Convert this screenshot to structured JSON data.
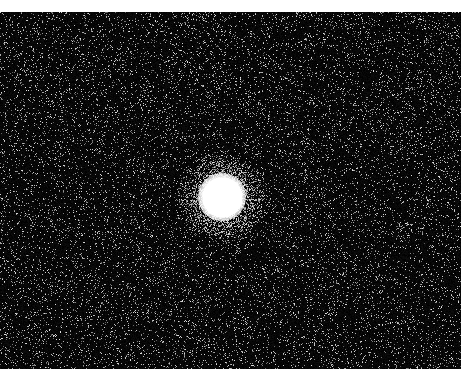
{
  "image": {
    "description": "Noisy astronomical field with a single bright star",
    "frame": {
      "x": 0,
      "y": 12,
      "width": 461,
      "height": 357
    },
    "background_color": "#020202",
    "page_background": "#ffffff",
    "star": {
      "cx": 222,
      "cy": 185,
      "core_radius": 20,
      "halo_radius": 48,
      "color": "#ffffff"
    },
    "noise": {
      "density": 0.09,
      "seed": 7
    }
  }
}
